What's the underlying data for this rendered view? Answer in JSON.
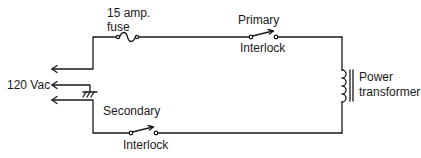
{
  "diagram": {
    "title": "",
    "labels": {
      "fuse_line1": "15 amp.",
      "fuse_line2": "fuse",
      "primary": "Primary",
      "primary_interlock": "Interlock",
      "voltage": "120 Vac",
      "secondary": "Secondary",
      "secondary_interlock": "Interlock",
      "transformer_line1": "Power",
      "transformer_line2": "transformer"
    },
    "components": [
      {
        "id": "fuse",
        "type": "fuse",
        "label": "15 amp. fuse"
      },
      {
        "id": "primary-interlock",
        "type": "switch",
        "label": "Primary Interlock"
      },
      {
        "id": "secondary-interlock",
        "type": "switch",
        "label": "Interlock"
      },
      {
        "id": "ground",
        "type": "chassis-ground",
        "label": "Secondary"
      },
      {
        "id": "transformer",
        "type": "inductor",
        "label": "Power transformer"
      },
      {
        "id": "source",
        "type": "ac-input",
        "label": "120 Vac",
        "terminals": 3
      }
    ],
    "colors": {
      "line": "#1a1a1a",
      "background": "#ffffff"
    }
  }
}
